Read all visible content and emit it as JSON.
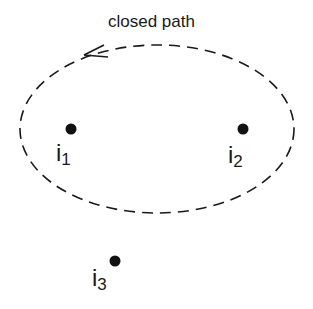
{
  "diagram": {
    "path_label": "closed path",
    "path_style": "dashed",
    "path_direction": "counterclockwise",
    "stroke_color": "#1a1a1a",
    "points": [
      {
        "id": "i1",
        "base": "i",
        "sub": "1",
        "inside_path": true
      },
      {
        "id": "i2",
        "base": "i",
        "sub": "2",
        "inside_path": true
      },
      {
        "id": "i3",
        "base": "i",
        "sub": "3",
        "inside_path": false
      }
    ]
  }
}
